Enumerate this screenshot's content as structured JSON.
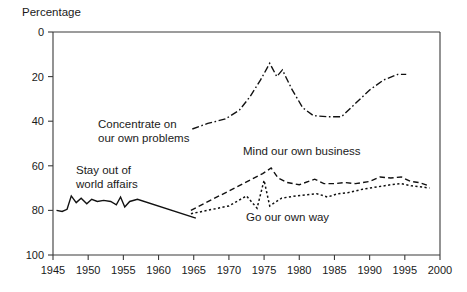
{
  "chart_data": {
    "type": "line",
    "title": "",
    "xlabel": "",
    "ylabel": "Percentage",
    "xlim": [
      1945,
      2000
    ],
    "ylim": [
      0,
      100
    ],
    "xticks": [
      1945,
      1950,
      1955,
      1960,
      1965,
      1970,
      1975,
      1980,
      1985,
      1990,
      1995,
      2000
    ],
    "yticks": [
      0,
      20,
      40,
      60,
      80,
      100
    ],
    "grid": false,
    "legend_position": "inline-annotations",
    "series": [
      {
        "name": "Stay out of world affairs",
        "style": "solid",
        "label_text": "Stay out of\nworld affairs",
        "points": [
          [
            1945.5,
            20
          ],
          [
            1946.3,
            19.5
          ],
          [
            1947.0,
            20.5
          ],
          [
            1947.6,
            26.5
          ],
          [
            1948.3,
            23.5
          ],
          [
            1949.0,
            25.5
          ],
          [
            1949.8,
            23.0
          ],
          [
            1950.5,
            25.0
          ],
          [
            1951.3,
            24.0
          ],
          [
            1952.2,
            24.5
          ],
          [
            1953.2,
            24.0
          ],
          [
            1954.0,
            22.5
          ],
          [
            1954.6,
            26.0
          ],
          [
            1955.2,
            21.5
          ],
          [
            1955.9,
            24.0
          ],
          [
            1957.0,
            25.0
          ],
          [
            1965.3,
            16.5
          ]
        ]
      },
      {
        "name": "Mind our own business",
        "style": "dashed",
        "label_text": "Mind our own business",
        "points": [
          [
            1964.6,
            20.0
          ],
          [
            1974.8,
            36.5
          ],
          [
            1976.0,
            39.0
          ],
          [
            1977.0,
            34.5
          ],
          [
            1978.3,
            32.5
          ],
          [
            1980.0,
            31.5
          ],
          [
            1982.2,
            34.0
          ],
          [
            1983.5,
            32.0
          ],
          [
            1985.0,
            32.0
          ],
          [
            1986.5,
            32.5
          ],
          [
            1988.0,
            32.0
          ],
          [
            1990.0,
            33.0
          ],
          [
            1991.5,
            35.0
          ],
          [
            1993.0,
            34.5
          ],
          [
            1994.5,
            35.0
          ],
          [
            1995.8,
            33.0
          ],
          [
            1997.0,
            32.5
          ],
          [
            1998.5,
            31.0
          ]
        ]
      },
      {
        "name": "Go our own way",
        "style": "dotted",
        "label_text": "Go our own way",
        "points": [
          [
            1964.6,
            18.5
          ],
          [
            1970.0,
            22.0
          ],
          [
            1972.5,
            26.5
          ],
          [
            1974.0,
            21.0
          ],
          [
            1975.0,
            33.5
          ],
          [
            1975.8,
            22.0
          ],
          [
            1977.5,
            25.5
          ],
          [
            1979.5,
            26.5
          ],
          [
            1981.0,
            27.0
          ],
          [
            1982.5,
            27.5
          ],
          [
            1984.0,
            26.0
          ],
          [
            1985.5,
            27.5
          ],
          [
            1987.0,
            28.0
          ],
          [
            1989.0,
            29.5
          ],
          [
            1991.0,
            30.5
          ],
          [
            1993.0,
            31.5
          ],
          [
            1994.5,
            32.0
          ],
          [
            1996.0,
            31.0
          ],
          [
            1997.5,
            30.5
          ],
          [
            1998.5,
            30.0
          ]
        ]
      },
      {
        "name": "Concentrate on our own problems",
        "style": "dashdot",
        "label_text": "Concentrate on\nour own problems",
        "points": [
          [
            1964.8,
            56.5
          ],
          [
            1967.0,
            59.0
          ],
          [
            1969.5,
            61.0
          ],
          [
            1971.5,
            65.0
          ],
          [
            1973.0,
            71.0
          ],
          [
            1974.5,
            78.5
          ],
          [
            1975.8,
            86.0
          ],
          [
            1976.8,
            80.0
          ],
          [
            1977.6,
            83.0
          ],
          [
            1979.0,
            74.0
          ],
          [
            1980.5,
            66.0
          ],
          [
            1982.0,
            62.5
          ],
          [
            1984.0,
            62.0
          ],
          [
            1986.0,
            62.0
          ],
          [
            1988.0,
            68.0
          ],
          [
            1990.0,
            74.0
          ],
          [
            1992.0,
            78.5
          ],
          [
            1994.0,
            81.0
          ],
          [
            1995.2,
            81.0
          ]
        ]
      }
    ],
    "annotations": [
      {
        "id": "concentrate-label",
        "text_line1": "Concentrate on",
        "text_line2": "our own problems",
        "x_px": 98,
        "y_px": 128
      },
      {
        "id": "stay-out-label",
        "text_line1": "Stay out of",
        "text_line2": "world affairs",
        "x_px": 76,
        "y_px": 174
      },
      {
        "id": "mind-label",
        "text_line1": "Mind our own business",
        "text_line2": "",
        "x_px": 243,
        "y_px": 155
      },
      {
        "id": "go-own-way-label",
        "text_line1": "Go our own way",
        "text_line2": "",
        "x_px": 246,
        "y_px": 221
      }
    ]
  },
  "axis": {
    "y_axis_title": "Percentage",
    "y_tick_labels": [
      "100",
      "80",
      "60",
      "40",
      "20",
      "0"
    ],
    "x_tick_labels": [
      "1945",
      "1950",
      "1955",
      "1960",
      "1965",
      "1970",
      "1975",
      "1980",
      "1985",
      "1990",
      "1995",
      "2000"
    ]
  },
  "colors": {
    "background": "#ffffff",
    "ink": "#111111",
    "axis": "#3a3a3a"
  }
}
